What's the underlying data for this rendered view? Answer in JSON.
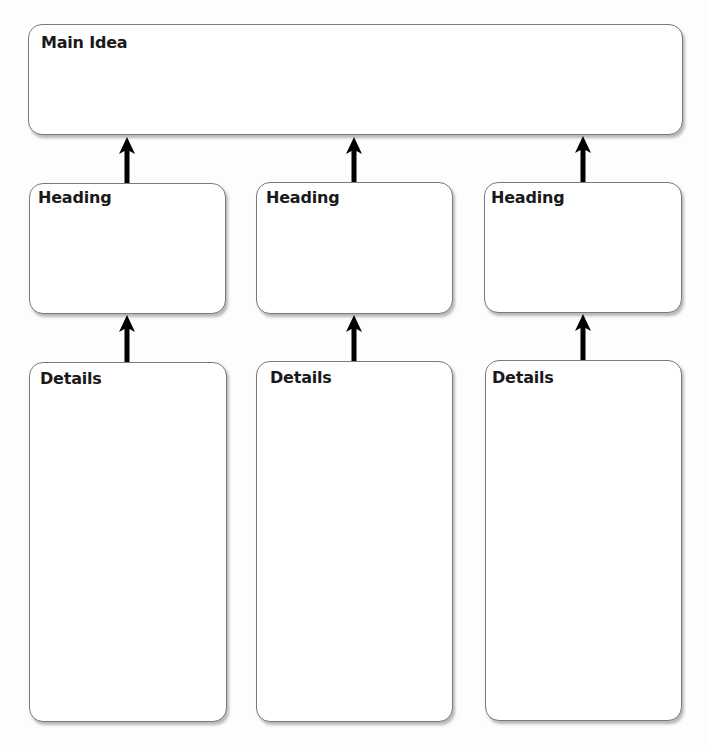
{
  "diagram": {
    "type": "graphic-organizer",
    "main_idea": {
      "label": "Main Idea"
    },
    "columns": [
      {
        "heading": {
          "label": "Heading"
        },
        "details": {
          "label": "Details"
        }
      },
      {
        "heading": {
          "label": "Heading"
        },
        "details": {
          "label": "Details"
        }
      },
      {
        "heading": {
          "label": "Heading"
        },
        "details": {
          "label": "Details"
        }
      }
    ],
    "arrows": [
      {
        "from": "heading-1",
        "to": "main-idea",
        "icon": "arrow-up-icon"
      },
      {
        "from": "heading-2",
        "to": "main-idea",
        "icon": "arrow-up-icon"
      },
      {
        "from": "heading-3",
        "to": "main-idea",
        "icon": "arrow-up-icon"
      },
      {
        "from": "details-1",
        "to": "heading-1",
        "icon": "arrow-up-icon"
      },
      {
        "from": "details-2",
        "to": "heading-2",
        "icon": "arrow-up-icon"
      },
      {
        "from": "details-3",
        "to": "heading-3",
        "icon": "arrow-up-icon"
      }
    ],
    "colors": {
      "border": "#7a7a7a",
      "arrow": "#000000",
      "text": "#1a1a1a",
      "background": "#fdfdfc"
    }
  }
}
